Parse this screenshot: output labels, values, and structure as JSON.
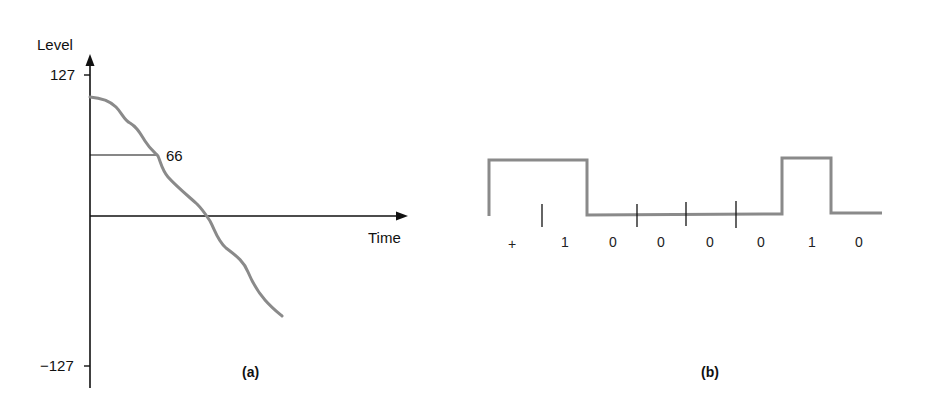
{
  "panel_a": {
    "y_axis_label": "Level",
    "x_axis_label": "Time",
    "y_max_label": "127",
    "y_min_label": "−127",
    "sample_label": "66",
    "caption": "(a)"
  },
  "panel_b": {
    "bits": [
      "+",
      "1",
      "0",
      "0",
      "0",
      "0",
      "1",
      "0"
    ],
    "caption": "(b)"
  },
  "colors": {
    "axis": "#111111",
    "signal": "#8a8a8a"
  }
}
